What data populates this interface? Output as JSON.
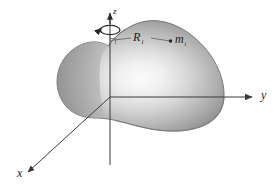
{
  "figure": {
    "background_color": "#ffffff",
    "axes": {
      "x_label": "x",
      "y_label": "y",
      "z_label": "z"
    },
    "annotations": {
      "radius_symbol": "R",
      "radius_subscript": "i",
      "mass_symbol": "m",
      "mass_subscript": "i"
    },
    "body": {
      "name": "rigid-body-blob",
      "fill_light": "#f4f4f4",
      "fill_mid": "#b8b8b8",
      "fill_dark": "#7d7d7d",
      "outline_color": "#6e6e6e"
    },
    "spin_indicator": {
      "name": "angular-velocity-arrow",
      "color": "#2b2b2b"
    },
    "line_color": "#3a3a3a",
    "point_marker_color": "#262626",
    "right_angle_marker": "perpendicular"
  }
}
